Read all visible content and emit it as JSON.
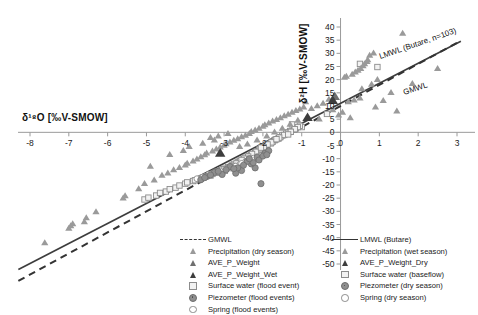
{
  "chart_data": {
    "type": "scatter",
    "title": "",
    "xlabel": "δ18O [‰V-SMOW]",
    "ylabel": "δ2H [‰V-SMOW]",
    "xlim": [
      -8.4,
      3.2
    ],
    "ylim": [
      -50,
      41
    ],
    "xticks": [
      -8,
      -7,
      -6,
      -5,
      -4,
      -3,
      -2,
      -1,
      0,
      1,
      2,
      3
    ],
    "xtick_labels": [
      "-8",
      "-7",
      "-6",
      "-5",
      "-4",
      "-3",
      "-2",
      "-1",
      "0",
      "1",
      "2",
      "3"
    ],
    "yticks": [
      40,
      35,
      30,
      25,
      20,
      15,
      10,
      5,
      0,
      -5,
      -10,
      -15,
      -20,
      -25,
      -30,
      -35,
      -40,
      -45,
      -50
    ],
    "ytick_labels": [
      "40",
      "35",
      "30",
      "25",
      "20",
      "15",
      "10",
      "5",
      "0",
      "-5",
      "-10",
      "-15",
      "-20",
      "-25",
      "-30",
      "-35",
      "-40",
      "-45",
      "-50"
    ],
    "grid": false,
    "legend_position": "bottom",
    "annotations": [
      {
        "text": "LMWL (Butare, n=103)",
        "x": 1.05,
        "y": 30.5,
        "rotation": -19
      },
      {
        "text": "GMWL",
        "x": 1.65,
        "y": 17.0,
        "rotation": -19
      }
    ],
    "lines": [
      {
        "name": "LMWL (Butare)",
        "style": "solid",
        "color": "#3d3d3d",
        "slope": 7.6,
        "intercept": 11.0,
        "x_range": [
          -8.3,
          3.1
        ]
      },
      {
        "name": "GMWL",
        "style": "dashed",
        "color": "#333333",
        "slope": 8.0,
        "intercept": 10.0,
        "x_range": [
          -8.3,
          3.1
        ]
      }
    ],
    "series": [
      {
        "name": "Precipitation (dry season)",
        "marker": "triangle",
        "color": "#9a9a9a",
        "points": [
          [
            -7.62,
            -42.0
          ],
          [
            -7.0,
            -36.5
          ],
          [
            -6.95,
            -35.6
          ],
          [
            -6.9,
            -34.8
          ],
          [
            -6.6,
            -34.0
          ],
          [
            -6.55,
            -32.5
          ],
          [
            -6.3,
            -30.2
          ],
          [
            -5.6,
            -25.0
          ],
          [
            -5.55,
            -24.2
          ],
          [
            -5.2,
            -21.5
          ],
          [
            -5.05,
            -19.5
          ],
          [
            -4.8,
            -18.2
          ],
          [
            -4.6,
            -16.4
          ],
          [
            -4.45,
            -15.5
          ],
          [
            -4.3,
            -14.3
          ],
          [
            -4.15,
            -13.4
          ],
          [
            -4.0,
            -12.5
          ],
          [
            -3.95,
            -11.8
          ],
          [
            -3.8,
            -11.0
          ],
          [
            -3.7,
            -10.2
          ],
          [
            -3.6,
            -9.4
          ],
          [
            -3.5,
            -8.6
          ],
          [
            -3.45,
            -7.9
          ],
          [
            -3.3,
            -7.2
          ],
          [
            -3.2,
            -6.4
          ],
          [
            -3.1,
            -5.7
          ],
          [
            -3.0,
            -5.0
          ],
          [
            -2.95,
            -4.4
          ],
          [
            -2.85,
            -3.8
          ],
          [
            -2.75,
            -3.1
          ],
          [
            -2.65,
            -2.5
          ],
          [
            -2.55,
            -1.8
          ],
          [
            -2.45,
            -1.2
          ],
          [
            -2.35,
            -0.5
          ],
          [
            -2.3,
            0.2
          ],
          [
            -2.2,
            0.8
          ],
          [
            -2.1,
            1.5
          ],
          [
            -2.0,
            2.2
          ],
          [
            -1.95,
            2.8
          ],
          [
            -1.85,
            3.5
          ],
          [
            -1.75,
            4.2
          ],
          [
            -1.65,
            4.8
          ],
          [
            -1.55,
            5.5
          ],
          [
            -1.45,
            6.2
          ],
          [
            -1.35,
            6.8
          ],
          [
            -1.25,
            7.5
          ],
          [
            -1.15,
            8.2
          ],
          [
            -1.05,
            8.8
          ],
          [
            -0.95,
            9.5
          ],
          [
            -3.9,
            -5.5
          ],
          [
            -3.55,
            -4.2
          ],
          [
            -3.25,
            -3.0
          ],
          [
            -4.4,
            -8.5
          ],
          [
            -4.9,
            -13.0
          ],
          [
            -2.6,
            -5.5
          ],
          [
            -2.4,
            -4.5
          ],
          [
            -2.15,
            -3.0
          ],
          [
            -1.9,
            -1.5
          ],
          [
            -1.7,
            0.0
          ],
          [
            -1.5,
            1.5
          ],
          [
            -1.3,
            3.0
          ],
          [
            -1.1,
            4.5
          ],
          [
            -3.15,
            -1.5
          ],
          [
            -2.9,
            -0.5
          ],
          [
            -3.35,
            -2.0
          ],
          [
            -4.05,
            -7.0
          ]
        ]
      },
      {
        "name": "Precipitation (wet season)",
        "marker": "triangle",
        "color": "#9a9a9a",
        "points": [
          [
            1.6,
            37.5
          ],
          [
            0.85,
            30.0
          ],
          [
            0.75,
            29.2
          ],
          [
            0.7,
            27.5
          ],
          [
            0.68,
            26.8
          ],
          [
            0.62,
            26.0
          ],
          [
            0.58,
            25.2
          ],
          [
            0.52,
            24.2
          ],
          [
            0.45,
            23.5
          ],
          [
            0.38,
            22.8
          ],
          [
            0.3,
            22.0
          ],
          [
            0.15,
            21.2
          ],
          [
            0.1,
            20.8
          ],
          [
            2.5,
            24.2
          ],
          [
            1.85,
            18.5
          ],
          [
            0.95,
            20.0
          ],
          [
            0.8,
            18.2
          ],
          [
            0.55,
            16.5
          ],
          [
            1.3,
            15.0
          ],
          [
            1.1,
            12.0
          ],
          [
            0.5,
            13.0
          ],
          [
            0.35,
            12.2
          ],
          [
            0.2,
            11.5
          ],
          [
            -0.3,
            12.5
          ],
          [
            -0.45,
            11.0
          ],
          [
            -0.6,
            10.0
          ],
          [
            -0.75,
            9.0
          ],
          [
            -0.9,
            11.5
          ],
          [
            -0.2,
            8.5
          ],
          [
            -0.05,
            6.5
          ],
          [
            0.05,
            7.5
          ],
          [
            -0.55,
            5.0
          ],
          [
            0.9,
            9.5
          ],
          [
            1.45,
            8.0
          ],
          [
            0.25,
            5.5
          ]
        ]
      },
      {
        "name": "AVE_P_Weight",
        "marker": "triangle",
        "color": "#6f6f6f",
        "points": [
          [
            -0.15,
            13.5
          ]
        ]
      },
      {
        "name": "AVE_P_Weight_Dry",
        "marker": "triangle",
        "color": "#3d3d3d",
        "points": [
          [
            -3.1,
            -8.0
          ]
        ]
      },
      {
        "name": "AVE_P_Weight_Wet",
        "marker": "triangle",
        "color": "#3d3d3d",
        "points": [
          [
            -0.2,
            12.0
          ],
          [
            -0.85,
            5.5
          ]
        ]
      },
      {
        "name": "Surface water (baseflow)",
        "marker": "square-open",
        "color": "#8c8c8c",
        "points": [
          [
            -1.15,
            1.5
          ],
          [
            -1.2,
            1.0
          ],
          [
            -1.3,
            0.5
          ],
          [
            -1.35,
            0.0
          ],
          [
            -1.4,
            -0.5
          ],
          [
            -1.5,
            -1.2
          ],
          [
            -1.55,
            -1.8
          ],
          [
            -1.6,
            -2.4
          ],
          [
            -1.7,
            -3.0
          ],
          [
            -1.75,
            -3.6
          ],
          [
            -1.8,
            -4.2
          ],
          [
            -1.9,
            -4.8
          ],
          [
            -1.95,
            -5.4
          ],
          [
            -2.0,
            -6.0
          ],
          [
            -2.1,
            -6.6
          ],
          [
            -2.15,
            -7.2
          ],
          [
            -2.2,
            -7.8
          ],
          [
            -2.3,
            -8.4
          ],
          [
            -2.35,
            -9.0
          ],
          [
            -2.45,
            -9.6
          ],
          [
            -2.5,
            -10.2
          ],
          [
            -2.6,
            -10.8
          ],
          [
            -2.65,
            -11.4
          ],
          [
            -2.75,
            -12.0
          ],
          [
            -2.8,
            -12.6
          ],
          [
            -2.9,
            -13.2
          ],
          [
            -3.0,
            -13.8
          ],
          [
            -3.1,
            -14.4
          ],
          [
            -3.2,
            -15.0
          ],
          [
            -3.3,
            -15.8
          ],
          [
            -3.45,
            -16.6
          ],
          [
            -3.6,
            -17.5
          ],
          [
            -3.8,
            -18.5
          ],
          [
            -4.0,
            -19.5
          ],
          [
            -4.25,
            -21.0
          ],
          [
            -4.5,
            -22.5
          ],
          [
            -4.75,
            -24.0
          ],
          [
            -5.05,
            -25.5
          ],
          [
            0.5,
            26.0
          ],
          [
            0.95,
            24.8
          ],
          [
            -0.35,
            7.0
          ],
          [
            -1.0,
            2.0
          ],
          [
            -1.05,
            2.5
          ],
          [
            -1.25,
            3.0
          ]
        ]
      },
      {
        "name": "Surface water (flood event)",
        "marker": "square-open",
        "color": "#8c8c8c",
        "points": [
          [
            -1.1,
            2.0
          ],
          [
            -1.18,
            1.2
          ],
          [
            -1.28,
            0.2
          ],
          [
            -1.45,
            -1.0
          ],
          [
            -1.58,
            -2.0
          ],
          [
            -1.68,
            -2.8
          ],
          [
            -1.78,
            -3.8
          ],
          [
            -1.88,
            -4.6
          ],
          [
            -1.98,
            -5.6
          ],
          [
            -2.08,
            -6.4
          ],
          [
            -2.18,
            -7.4
          ],
          [
            -2.28,
            -8.2
          ],
          [
            -2.38,
            -9.2
          ],
          [
            -2.48,
            -10.0
          ],
          [
            -2.58,
            -11.0
          ],
          [
            -2.68,
            -11.8
          ],
          [
            -2.78,
            -12.8
          ],
          [
            -2.88,
            -13.6
          ],
          [
            -2.98,
            -14.6
          ],
          [
            -3.15,
            -15.4
          ],
          [
            -3.35,
            -16.4
          ],
          [
            -3.55,
            -17.2
          ],
          [
            -3.75,
            -18.2
          ],
          [
            -3.95,
            -19.0
          ],
          [
            -4.15,
            -20.2
          ],
          [
            -4.4,
            -21.6
          ],
          [
            -4.65,
            -23.0
          ],
          [
            -4.95,
            -24.8
          ],
          [
            -1.35,
            -0.8
          ],
          [
            -1.65,
            -2.6
          ],
          [
            -2.05,
            -5.8
          ],
          [
            -2.55,
            -10.5
          ],
          [
            -3.05,
            -14.0
          ],
          [
            -3.65,
            -17.8
          ]
        ]
      },
      {
        "name": "Piezometer (dry season)",
        "marker": "circle-filled",
        "color": "#8f8f8f",
        "points": [
          [
            -2.05,
            -19.5
          ],
          [
            -2.2,
            -13.5
          ],
          [
            -2.3,
            -12.0
          ],
          [
            -2.55,
            -14.5
          ],
          [
            -2.7,
            -15.5
          ],
          [
            -2.85,
            -13.0
          ],
          [
            -3.05,
            -16.0
          ],
          [
            -3.25,
            -15.2
          ],
          [
            -3.45,
            -16.8
          ],
          [
            -2.4,
            -11.0
          ],
          [
            -2.15,
            -9.5
          ],
          [
            -1.95,
            -8.0
          ],
          [
            -1.85,
            -7.0
          ],
          [
            -3.6,
            -18.0
          ]
        ]
      },
      {
        "name": "Piezometer (flood events)",
        "marker": "circle-filled",
        "color": "#8f8f8f",
        "points": [
          [
            -2.1,
            -10.5
          ],
          [
            -2.25,
            -11.5
          ],
          [
            -2.5,
            -12.5
          ],
          [
            -2.65,
            -13.5
          ],
          [
            -2.95,
            -14.2
          ],
          [
            -3.15,
            -14.8
          ],
          [
            -3.35,
            -16.2
          ],
          [
            -2.35,
            -10.0
          ],
          [
            -2.0,
            -9.0
          ],
          [
            -1.9,
            -8.5
          ],
          [
            -3.5,
            -17.2
          ],
          [
            -2.75,
            -13.8
          ]
        ]
      },
      {
        "name": "Spring (dry season)",
        "marker": "circle-open",
        "color": "#8c8c8c",
        "points": [
          [
            -2.45,
            -11.2
          ],
          [
            -2.6,
            -12.2
          ],
          [
            -2.8,
            -13.2
          ],
          [
            -3.0,
            -14.0
          ],
          [
            -3.2,
            -15.0
          ],
          [
            -2.3,
            -10.2
          ],
          [
            -2.15,
            -9.2
          ],
          [
            -3.4,
            -16.0
          ],
          [
            -3.7,
            -17.6
          ]
        ]
      },
      {
        "name": "Spring (flood events)",
        "marker": "circle-open",
        "color": "#8c8c8c",
        "points": [
          [
            -2.4,
            -10.8
          ],
          [
            -2.55,
            -11.8
          ],
          [
            -2.7,
            -12.8
          ],
          [
            -2.9,
            -13.6
          ],
          [
            -3.1,
            -14.6
          ],
          [
            -2.25,
            -9.8
          ],
          [
            -3.3,
            -15.6
          ],
          [
            -3.55,
            -17.0
          ]
        ]
      }
    ]
  },
  "legend": {
    "left_column": [
      {
        "symbol": "line-dashed",
        "label": "GMWL"
      },
      {
        "symbol": "triangle-light",
        "label": "Precipitation (dry season)"
      },
      {
        "symbol": "triangle-mid",
        "label": "AVE_P_Weight"
      },
      {
        "symbol": "triangle-dark",
        "label": "AVE_P_Weight_Wet"
      },
      {
        "symbol": "square-open",
        "label": "Surface water (flood event)"
      },
      {
        "symbol": "circle-filled",
        "label": "Piezometer (flood events)"
      },
      {
        "symbol": "circle-open",
        "label": "Spring (flood events)"
      }
    ],
    "right_column": [
      {
        "symbol": "line-solid",
        "label": "LMWL (Butare)"
      },
      {
        "symbol": "triangle-light",
        "label": "Precipitation (wet season)"
      },
      {
        "symbol": "triangle-dark",
        "label": "AVE_P_Weight_Dry"
      },
      {
        "symbol": "square-open",
        "label": "Surface water (baseflow)"
      },
      {
        "symbol": "circle-filled",
        "label": "Piezometer (dry season)"
      },
      {
        "symbol": "circle-open",
        "label": "Spring (dry season)"
      }
    ]
  },
  "colors": {
    "axis": "#9a9a9a",
    "text": "#1a1a1a",
    "lmwl": "#3d3d3d",
    "gmwl": "#333333",
    "marker_light": "#9a9a9a",
    "marker_dark": "#3d3d3d",
    "square": "#8c8c8c"
  }
}
